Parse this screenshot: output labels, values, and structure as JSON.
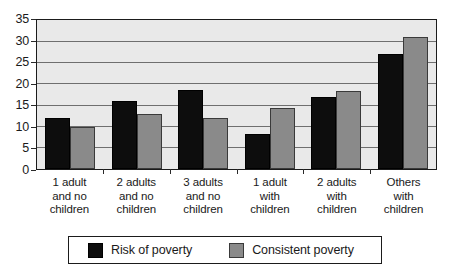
{
  "chart_data": {
    "type": "bar",
    "title": "",
    "subtitle": "",
    "xlabel": "",
    "ylabel": "",
    "ylim": [
      0,
      35
    ],
    "ytick_step": 5,
    "yticks": [
      35,
      30,
      25,
      20,
      15,
      10,
      5,
      0
    ],
    "grid": true,
    "legend_position": "bottom",
    "categories": [
      [
        "1 adult",
        "and no",
        "children"
      ],
      [
        "2 adults",
        "and no",
        "children"
      ],
      [
        "3 adults",
        "and no",
        "children"
      ],
      [
        "1 adult",
        "with",
        "children"
      ],
      [
        "2 adults",
        "with",
        "children"
      ],
      [
        "Others",
        "with",
        "children"
      ]
    ],
    "category_labels_flat": [
      "1 adult and no children",
      "2 adults and no children",
      "3 adults and no children",
      "1 adult with children",
      "2 adults with children",
      "Others with children"
    ],
    "series": [
      {
        "name": "Risk of poverty",
        "color": "#0d0d0d",
        "values": [
          12,
          16,
          18.7,
          8.2,
          17,
          27.3
        ]
      },
      {
        "name": "Consistent poverty",
        "color": "#8a8a8a",
        "values": [
          10,
          13,
          12,
          14.5,
          18.5,
          31.3
        ]
      }
    ]
  },
  "legend": {
    "items": [
      {
        "label": "Risk of poverty"
      },
      {
        "label": "Consistent poverty"
      }
    ]
  },
  "style": {
    "plot_background": "#e9e9e9",
    "axis_color": "#1b1b1b",
    "gridline_color": "#6f6f6f",
    "page_background": "#ffffff"
  }
}
